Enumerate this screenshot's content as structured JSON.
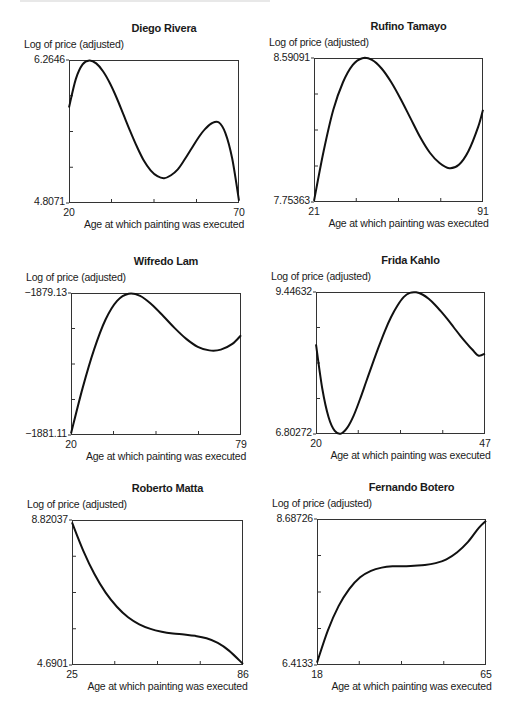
{
  "chart_data": [
    {
      "type": "line",
      "title": "Diego Rivera",
      "ylabel": "Log of price (adjusted)",
      "xlabel": "Age at which painting was executed",
      "xlim": [
        20,
        70
      ],
      "ylim": [
        4.8071,
        6.2646
      ],
      "x_tick_labels": [
        "20",
        "70"
      ],
      "y_tick_labels": [
        "6.2646",
        "4.8071"
      ],
      "grid": false,
      "x": [
        20,
        22,
        24,
        26,
        28,
        30,
        32,
        34,
        36,
        38,
        40,
        42,
        44,
        46,
        48,
        50,
        52,
        54,
        56,
        58,
        60,
        62,
        64,
        66,
        68,
        70
      ],
      "values": [
        5.78,
        6.07,
        6.22,
        6.26,
        6.23,
        6.15,
        6.03,
        5.88,
        5.71,
        5.54,
        5.38,
        5.24,
        5.14,
        5.08,
        5.06,
        5.09,
        5.15,
        5.25,
        5.36,
        5.47,
        5.56,
        5.62,
        5.63,
        5.52,
        5.26,
        4.83
      ]
    },
    {
      "type": "line",
      "title": "Rufino Tamayo",
      "ylabel": "Log of price (adjusted)",
      "xlabel": "Age at which painting was executed",
      "xlim": [
        21,
        91
      ],
      "ylim": [
        7.75363,
        8.59091
      ],
      "x_tick_labels": [
        "21",
        "91"
      ],
      "y_tick_labels": [
        "8.59091",
        "7.75363"
      ],
      "grid": false,
      "x": [
        21,
        25,
        29,
        33,
        37,
        41,
        45,
        49,
        53,
        57,
        61,
        65,
        69,
        73,
        77,
        81,
        85,
        89,
        91
      ],
      "values": [
        7.76,
        8.05,
        8.29,
        8.45,
        8.55,
        8.59,
        8.58,
        8.53,
        8.45,
        8.35,
        8.24,
        8.13,
        8.04,
        7.98,
        7.95,
        7.97,
        8.05,
        8.19,
        8.29
      ]
    },
    {
      "type": "line",
      "title": "Wifredo Lam",
      "ylabel": "Log of price (adjusted)",
      "xlabel": "Age at which painting was executed",
      "xlim": [
        20,
        79
      ],
      "ylim": [
        -1881.11,
        -1879.13
      ],
      "x_tick_labels": [
        "20",
        "79"
      ],
      "y_tick_labels": [
        "-1879.13",
        "-1881.11"
      ],
      "grid": false,
      "x": [
        20,
        24,
        28,
        32,
        36,
        40,
        44,
        48,
        52,
        56,
        60,
        64,
        68,
        72,
        76,
        79
      ],
      "values": [
        -1881.09,
        -1880.46,
        -1879.92,
        -1879.5,
        -1879.24,
        -1879.14,
        -1879.17,
        -1879.29,
        -1879.45,
        -1879.62,
        -1879.77,
        -1879.88,
        -1879.93,
        -1879.92,
        -1879.84,
        -1879.72
      ]
    },
    {
      "type": "line",
      "title": "Frida Kahlo",
      "ylabel": "Log of price (adjusted)",
      "xlabel": "Age at which painting was executed",
      "xlim": [
        20,
        47
      ],
      "ylim": [
        6.80272,
        9.44632
      ],
      "x_tick_labels": [
        "20",
        "47"
      ],
      "y_tick_labels": [
        "9.44632",
        "6.80272"
      ],
      "grid": false,
      "x": [
        20,
        21,
        22,
        23,
        24,
        25,
        26,
        27,
        28,
        29,
        30,
        31,
        32,
        33,
        34,
        35,
        36,
        37,
        38,
        39,
        40,
        41,
        42,
        43,
        44,
        45,
        46,
        47
      ],
      "values": [
        8.47,
        7.65,
        7.12,
        6.86,
        6.81,
        6.92,
        7.14,
        7.44,
        7.77,
        8.1,
        8.42,
        8.72,
        8.98,
        9.19,
        9.35,
        9.43,
        9.44,
        9.4,
        9.32,
        9.21,
        9.08,
        8.94,
        8.79,
        8.64,
        8.5,
        8.37,
        8.26,
        8.3
      ]
    },
    {
      "type": "line",
      "title": "Roberto Matta",
      "ylabel": "Log of price (adjusted)",
      "xlabel": "Age at which painting was executed",
      "xlim": [
        25,
        86
      ],
      "ylim": [
        4.6901,
        8.82037
      ],
      "x_tick_labels": [
        "25",
        "86"
      ],
      "y_tick_labels": [
        "8.82037",
        "4.6901"
      ],
      "grid": false,
      "x": [
        25,
        29,
        33,
        37,
        41,
        45,
        49,
        53,
        57,
        61,
        65,
        69,
        73,
        77,
        81,
        86
      ],
      "values": [
        8.75,
        7.95,
        7.28,
        6.75,
        6.35,
        6.05,
        5.85,
        5.72,
        5.64,
        5.59,
        5.56,
        5.52,
        5.45,
        5.32,
        5.1,
        4.72
      ]
    },
    {
      "type": "line",
      "title": "Fernando Botero",
      "ylabel": "Log of price (adjusted)",
      "xlabel": "Age at which painting was executed",
      "xlim": [
        18,
        65
      ],
      "ylim": [
        6.4133,
        8.68726
      ],
      "x_tick_labels": [
        "18",
        "65"
      ],
      "y_tick_labels": [
        "8.68726",
        "6.4133"
      ],
      "grid": false,
      "x": [
        18,
        21,
        24,
        27,
        30,
        33,
        36,
        39,
        42,
        45,
        48,
        51,
        54,
        57,
        60,
        63,
        65
      ],
      "values": [
        6.45,
        6.95,
        7.33,
        7.6,
        7.78,
        7.88,
        7.93,
        7.95,
        7.95,
        7.96,
        7.97,
        8.0,
        8.06,
        8.17,
        8.33,
        8.55,
        8.66
      ]
    }
  ]
}
